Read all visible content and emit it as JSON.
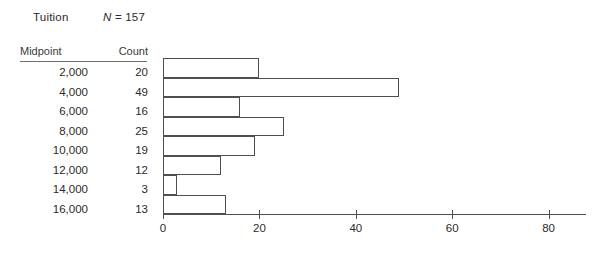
{
  "header": {
    "variable_label": "Tuition",
    "n_symbol": "N",
    "n_text": " = 157"
  },
  "table": {
    "columns": [
      "Midpoint",
      "Count"
    ],
    "rows": [
      {
        "midpoint": "2,000",
        "count": "20"
      },
      {
        "midpoint": "4,000",
        "count": "49"
      },
      {
        "midpoint": "6,000",
        "count": "16"
      },
      {
        "midpoint": "8,000",
        "count": "25"
      },
      {
        "midpoint": "10,000",
        "count": "19"
      },
      {
        "midpoint": "12,000",
        "count": "12"
      },
      {
        "midpoint": "14,000",
        "count": "3"
      },
      {
        "midpoint": "16,000",
        "count": "13"
      }
    ]
  },
  "chart_data": {
    "type": "bar",
    "orientation": "horizontal",
    "title": "Tuition",
    "xlabel": "",
    "ylabel": "",
    "categories": [
      "2,000",
      "4,000",
      "6,000",
      "8,000",
      "10,000",
      "12,000",
      "14,000",
      "16,000"
    ],
    "values": [
      20,
      49,
      16,
      25,
      19,
      12,
      3,
      13
    ],
    "total_n": 157,
    "xlim": [
      0,
      88
    ],
    "xticks": [
      0,
      20,
      40,
      60,
      80
    ],
    "xtick_labels": [
      "0",
      "20",
      "40",
      "60",
      "80"
    ],
    "grid": false,
    "legend": "none",
    "bar_fill": "#ffffff",
    "bar_stroke": "#4f4f4f"
  },
  "style": {
    "background": "#ffffff",
    "text_color": "#2b2b2b",
    "line_color": "#4f4f4f"
  }
}
